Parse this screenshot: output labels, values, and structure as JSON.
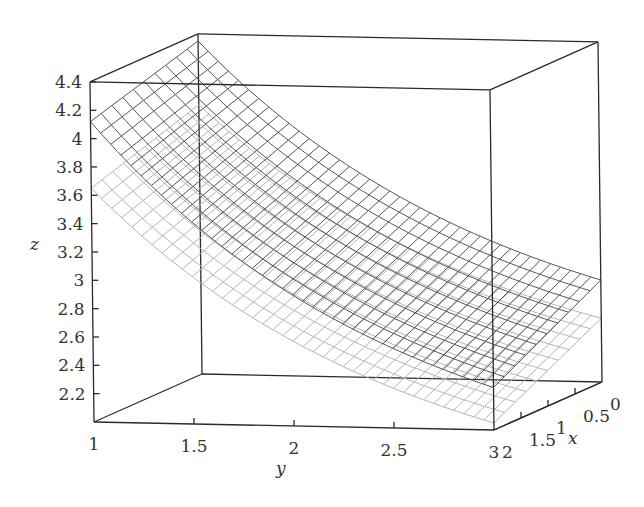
{
  "chart_data": {
    "type": "surface3d",
    "title": "",
    "xlabel": "x",
    "ylabel": "y",
    "zlabel": "z",
    "x_range": [
      0,
      2
    ],
    "y_range": [
      1,
      3
    ],
    "zlim": [
      2.0,
      4.4
    ],
    "x_ticks": [
      "0",
      "0.5",
      "1",
      "1.5",
      "2"
    ],
    "y_ticks": [
      "1",
      "1.5",
      "2",
      "2.5",
      "3"
    ],
    "z_ticks": [
      "2.2",
      "2.4",
      "2.6",
      "2.8",
      "3",
      "3.2",
      "3.4",
      "3.6",
      "3.8",
      "4",
      "4.2",
      "4.4"
    ],
    "grid": false,
    "legend": null,
    "series": [
      {
        "name": "upper surface (dark mesh)",
        "color": "#555555",
        "corner_values": {
          "x2_y1": 4.12,
          "x0_y1": 4.35,
          "x2_y3": 2.3,
          "x0_y3": 2.72
        }
      },
      {
        "name": "lower surface (light mesh)",
        "color": "#b5b5b5",
        "corner_values": {
          "x2_y1": 3.65,
          "x0_y1": 3.9,
          "x2_y3": 2.05,
          "x0_y3": 2.45
        }
      }
    ]
  },
  "axes": {
    "z_label": "z",
    "y_label": "y",
    "x_label": "x"
  }
}
